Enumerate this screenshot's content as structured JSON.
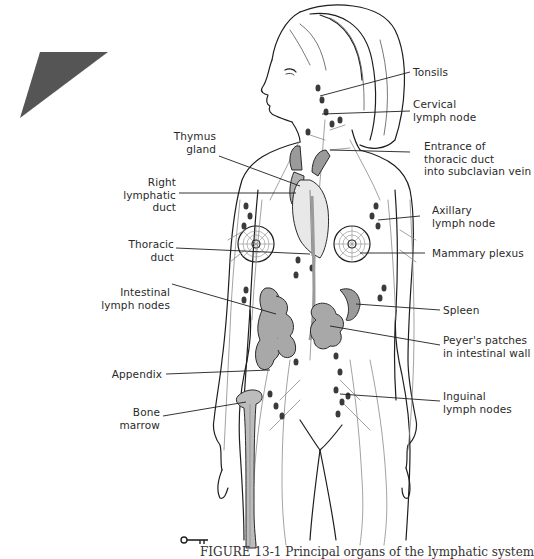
{
  "figure": {
    "title": "Principal organs of the lymphatic system",
    "caption": "FIGURE 13-1  Principal organs of the lymphatic system",
    "caption_clipped": true,
    "key_icon": "key-icon",
    "corner_marker": {
      "shape": "triangle",
      "color": "#555555"
    },
    "colors": {
      "line_art": "#1e1e1e",
      "vessels": "#8a8a8a",
      "lymph_nodes": "#3a3a3a",
      "organs_fill": "#9a9a9a",
      "bone_fill": "#bcbcbc"
    }
  },
  "labels": {
    "right": [
      {
        "id": "tonsils",
        "lines": [
          "Tonsils"
        ]
      },
      {
        "id": "cervical",
        "lines": [
          "Cervical",
          "lymph node"
        ]
      },
      {
        "id": "thoracic-entrance",
        "lines": [
          "Entrance of",
          "thoracic duct",
          "into subclavian vein"
        ]
      },
      {
        "id": "axillary",
        "lines": [
          "Axillary",
          "lymph node"
        ]
      },
      {
        "id": "mammary",
        "lines": [
          "Mammary plexus"
        ]
      },
      {
        "id": "spleen",
        "lines": [
          "Spleen"
        ]
      },
      {
        "id": "peyers",
        "lines": [
          "Peyer's patches",
          "in intestinal wall"
        ]
      },
      {
        "id": "inguinal",
        "lines": [
          "Inguinal",
          "lymph nodes"
        ]
      }
    ],
    "left": [
      {
        "id": "thymus",
        "lines": [
          "Thymus",
          "gland"
        ]
      },
      {
        "id": "right-lymphatic",
        "lines": [
          "Right",
          "lymphatic",
          "duct"
        ]
      },
      {
        "id": "thoracic-duct",
        "lines": [
          "Thoracic",
          "duct"
        ]
      },
      {
        "id": "intestinal",
        "lines": [
          "Intestinal",
          "lymph nodes"
        ]
      },
      {
        "id": "appendix",
        "lines": [
          "Appendix"
        ]
      },
      {
        "id": "bone-marrow",
        "lines": [
          "Bone",
          "marrow"
        ]
      }
    ]
  }
}
